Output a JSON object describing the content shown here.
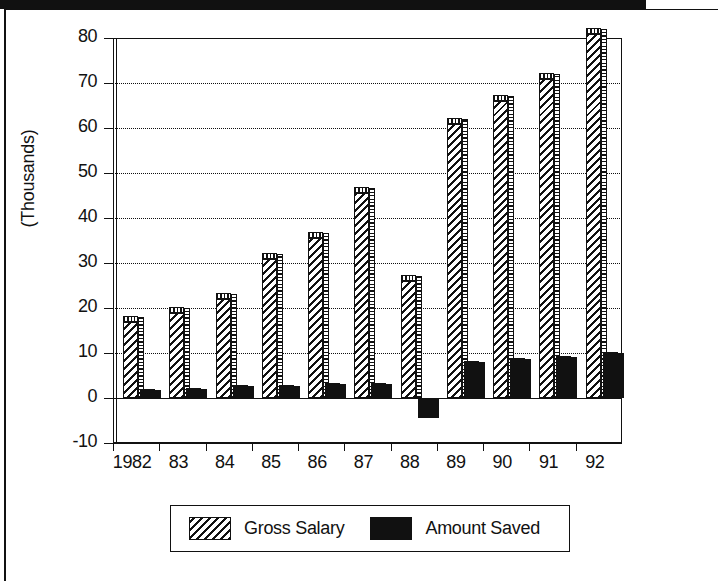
{
  "chart_data": {
    "type": "bar",
    "title": "",
    "subtitle": "",
    "xlabel": "",
    "ylabel": "(Thousands)",
    "categories": [
      "1982",
      "83",
      "84",
      "85",
      "86",
      "87",
      "88",
      "89",
      "90",
      "91",
      "92"
    ],
    "series": [
      {
        "name": "Gross Salary",
        "fill": "diagonal-hatch",
        "color": "#111111",
        "values": [
          17,
          19,
          22,
          31,
          35.5,
          45.5,
          26,
          61,
          66,
          71,
          81
        ]
      },
      {
        "name": "Amount Saved",
        "fill": "solid-black",
        "color": "#111111",
        "values": [
          0.6,
          1,
          1.5,
          1.5,
          2,
          2,
          -4.5,
          7,
          7.5,
          8,
          9
        ]
      }
    ],
    "ylim": [
      -10,
      80
    ],
    "ytick_values": [
      -10,
      0,
      10,
      20,
      30,
      40,
      50,
      60,
      70,
      80
    ],
    "ytick_labels": [
      "-10",
      "0",
      "10",
      "20",
      "30",
      "40",
      "50",
      "60",
      "70",
      "80"
    ],
    "grid": true,
    "grid_style": "dotted-horizontal",
    "legend_position": "bottom",
    "legend_entries": [
      "Gross Salary",
      "Amount Saved"
    ]
  },
  "axis": {
    "y_title": "(Thousands)"
  },
  "legend": {
    "items": [
      {
        "label": "Gross Salary",
        "swatch": "diagonal-hatch-swatch"
      },
      {
        "label": "Amount Saved",
        "swatch": "solid-black-swatch"
      }
    ]
  }
}
